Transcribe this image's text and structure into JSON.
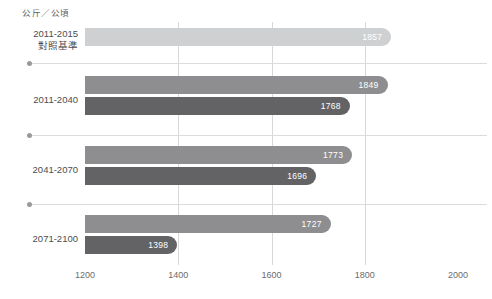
{
  "unit_title": "公斤／公頃",
  "chart_data": {
    "type": "bar",
    "orientation": "horizontal",
    "title": "",
    "subtitle": "",
    "xlabel": "",
    "ylabel": "公斤／公頃",
    "xlim": [
      1200,
      2000
    ],
    "xticks": [
      1200,
      1400,
      1600,
      1800,
      2000
    ],
    "xtick_labels": [
      "1200",
      "1400",
      "1600",
      "1800",
      "2000"
    ],
    "grid": "vertical gridlines at 1400, 1600, 1800",
    "legend": "none",
    "categories": [
      "2011-2015 對照基準",
      "2011-2040",
      "2041-2070",
      "2071-2100"
    ],
    "groups": [
      {
        "label_line1": "2011-2015",
        "label_line2": "對照基準",
        "bars": [
          {
            "value": 1857,
            "value_label": "1857",
            "color": "#cfd0d1",
            "series": "baseline"
          }
        ]
      },
      {
        "label_line1": "2011-2040",
        "label_line2": "",
        "bars": [
          {
            "value": 1849,
            "value_label": "1849",
            "color": "#8e8e90",
            "series": "upper"
          },
          {
            "value": 1768,
            "value_label": "1768",
            "color": "#636365",
            "series": "lower"
          }
        ]
      },
      {
        "label_line1": "2041-2070",
        "label_line2": "",
        "bars": [
          {
            "value": 1773,
            "value_label": "1773",
            "color": "#8e8e90",
            "series": "upper"
          },
          {
            "value": 1696,
            "value_label": "1696",
            "color": "#636365",
            "series": "lower"
          }
        ]
      },
      {
        "label_line1": "2071-2100",
        "label_line2": "",
        "bars": [
          {
            "value": 1727,
            "value_label": "1727",
            "color": "#8e8e90",
            "series": "upper"
          },
          {
            "value": 1398,
            "value_label": "1398",
            "color": "#636365",
            "series": "lower"
          }
        ]
      }
    ],
    "values_flat": [
      1857,
      1849,
      1768,
      1773,
      1696,
      1727,
      1398
    ]
  },
  "colors": {
    "baseline_bar": "#cfd0d1",
    "upper_bar": "#8e8e90",
    "lower_bar": "#636365",
    "gridline": "#d8d8d8",
    "separator": "#dcdcdc",
    "separator_dot": "#9a9a9a",
    "text": "#4d4d4f",
    "value_text": "#ffffff",
    "background": "#ffffff"
  }
}
